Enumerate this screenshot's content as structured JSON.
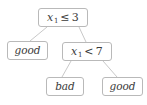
{
  "figure": {
    "type": "decision-tree",
    "background_color": "#ffffff",
    "node_border_color": "#b9b9b9",
    "edge_color": "#c0c0c0",
    "text_color": "#3a3a3a"
  },
  "nodes": {
    "root": {
      "id": "root",
      "kind": "split",
      "variable": "x",
      "subscript": "1",
      "operator": "≤",
      "threshold": "3",
      "text": "x1 ≤ 3"
    },
    "good_left": {
      "id": "good-left",
      "kind": "leaf",
      "label": "good"
    },
    "split2": {
      "id": "split2",
      "kind": "split",
      "variable": "x",
      "subscript": "1",
      "operator": "<",
      "threshold": "7",
      "text": "x1 < 7"
    },
    "bad": {
      "id": "bad",
      "kind": "leaf",
      "label": "bad"
    },
    "good_right": {
      "id": "good-right",
      "kind": "leaf",
      "label": "good"
    }
  },
  "edges": [
    {
      "from": "root",
      "to": "good_left",
      "branch": "left"
    },
    {
      "from": "root",
      "to": "split2",
      "branch": "right"
    },
    {
      "from": "split2",
      "to": "bad",
      "branch": "left"
    },
    {
      "from": "split2",
      "to": "good_right",
      "branch": "right"
    }
  ]
}
